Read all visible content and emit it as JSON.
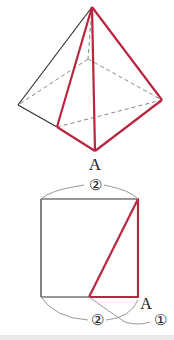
{
  "colors": {
    "red": "#b8263f",
    "black": "#333333",
    "dashed": "#888888",
    "arc": "#999999"
  },
  "pyramid": {
    "apex": [
      92,
      7
    ],
    "left": [
      18,
      105
    ],
    "front_left": [
      57,
      127
    ],
    "bottom": [
      95,
      151
    ],
    "right": [
      162,
      100
    ],
    "back": [
      88,
      59
    ],
    "label_A": "A"
  },
  "square": {
    "x": 41,
    "y": 199,
    "size": 97,
    "mid_bottom_x": 89,
    "label_top": "②",
    "label_bottom": "②",
    "label_one": "①",
    "label_A": "A"
  }
}
